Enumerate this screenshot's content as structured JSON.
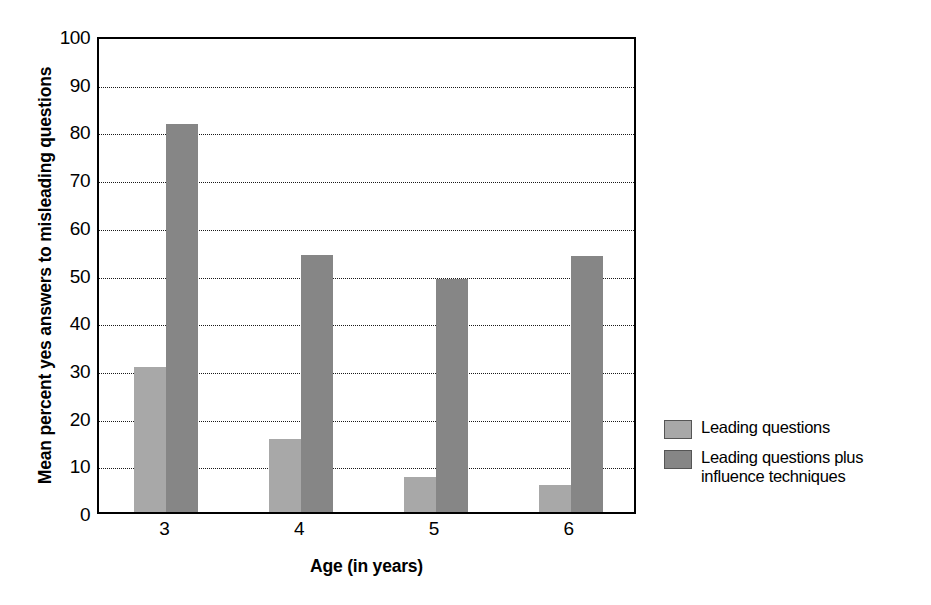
{
  "chart_data": {
    "type": "bar",
    "title": "",
    "xlabel": "Age (in years)",
    "ylabel": "Mean percent yes answers to misleading questions",
    "categories": [
      "3",
      "4",
      "5",
      "6"
    ],
    "series": [
      {
        "name": "Leading questions",
        "color": "#a8a8a8",
        "values": [
          30.4,
          15.3,
          7.3,
          5.7
        ]
      },
      {
        "name": "Leading questions plus influence techniques",
        "color": "#868686",
        "values": [
          81.3,
          53.9,
          48.8,
          53.6
        ]
      }
    ],
    "ylim": [
      0,
      100
    ],
    "ytick_step": 10,
    "yticks": [
      "0",
      "10",
      "20",
      "30",
      "40",
      "50",
      "60",
      "70",
      "80",
      "90",
      "100"
    ],
    "grid": true,
    "grid_axis": "y",
    "legend_position": "right"
  },
  "legend": {
    "items": [
      {
        "label": "Leading questions",
        "swatch": "light-gray-swatch"
      },
      {
        "label": "Leading questions plus influence techniques",
        "swatch": "dark-gray-swatch"
      }
    ]
  },
  "colors": {
    "light_bar": "#a8a8a8",
    "dark_bar": "#868686",
    "axis": "#000000",
    "gridline": "#1a1a1a",
    "background": "#ffffff"
  }
}
